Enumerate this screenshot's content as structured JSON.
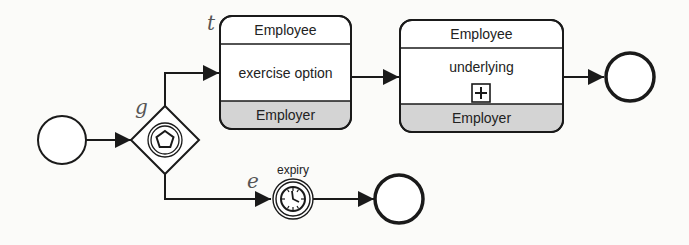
{
  "diagram": {
    "type": "BPMN choreography",
    "gateway": {
      "label": "g",
      "kind": "event-based gateway"
    },
    "tasks": [
      {
        "label": "t",
        "top_participant": "Employee",
        "name": "exercise option",
        "bottom_participant": "Employer",
        "subprocess": false
      },
      {
        "label": "",
        "top_participant": "Employee",
        "name": "underlying",
        "bottom_participant": "Employer",
        "subprocess": true
      }
    ],
    "timer_event": {
      "label": "e",
      "name": "expiry"
    },
    "colors": {
      "stroke": "#1a1a1a",
      "shade": "#d4d4d4",
      "label": "#555555"
    }
  }
}
